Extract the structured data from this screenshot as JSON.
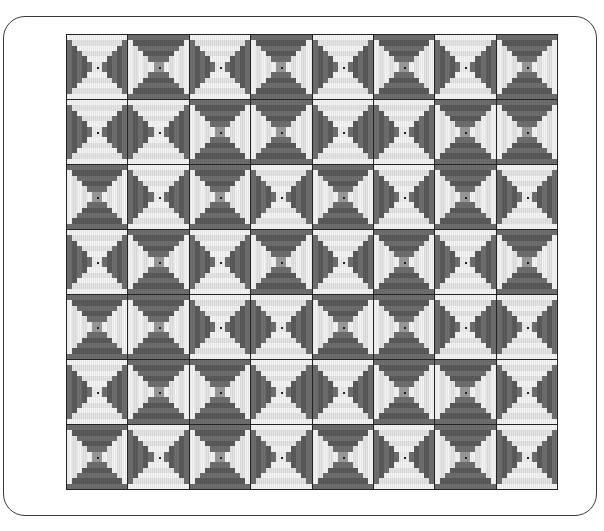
{
  "artwork": {
    "title": "Log Cabin Courthouse Steps Quilt",
    "medium": "quilt pattern illustration",
    "frame_shape": "rounded-rectangle",
    "frame_color": "#3a3a3a",
    "background_color": "#ffffff"
  },
  "grid": {
    "columns": 8,
    "rows": 7,
    "block_count": 56,
    "block_width_px": 61,
    "block_height_px": 65,
    "grid_left_px": 66,
    "grid_top_px": 34,
    "grid_width_px": 492,
    "grid_height_px": 456,
    "seam_color": "#1a1a1a"
  },
  "palette": {
    "dark": "#6e6e6e",
    "dark_shadow": "#5a5a5a",
    "light": "#f4f4f4",
    "light_alt": "#e4e4e4",
    "mid": "#9a9a9a",
    "center_dark": "#7a7a7a",
    "center_light": "#ededed",
    "seam": "#1a1a1a",
    "outline": "#242424"
  },
  "block": {
    "style": "courthouse-steps",
    "ring_count": 6,
    "description": "Concentric rectangular rings; horizontal logs one value, vertical logs the opposite value, alternating per ring.",
    "orientations": [
      "light-horizontal",
      "dark-horizontal"
    ]
  },
  "layout_map": {
    "note": "Per-block orientation flag. 0 = light horizontal logs / dark vertical logs, 1 = dark horizontal logs / light vertical logs.",
    "rows": [
      [
        0,
        1,
        0,
        1,
        0,
        1,
        0,
        1
      ],
      [
        0,
        0,
        1,
        1,
        0,
        0,
        1,
        1
      ],
      [
        1,
        0,
        1,
        0,
        1,
        0,
        1,
        0
      ],
      [
        0,
        1,
        0,
        1,
        0,
        1,
        0,
        1
      ],
      [
        1,
        1,
        0,
        0,
        1,
        1,
        0,
        0
      ],
      [
        0,
        1,
        1,
        0,
        0,
        1,
        1,
        0
      ],
      [
        1,
        0,
        1,
        0,
        1,
        0,
        1,
        0
      ]
    ]
  }
}
